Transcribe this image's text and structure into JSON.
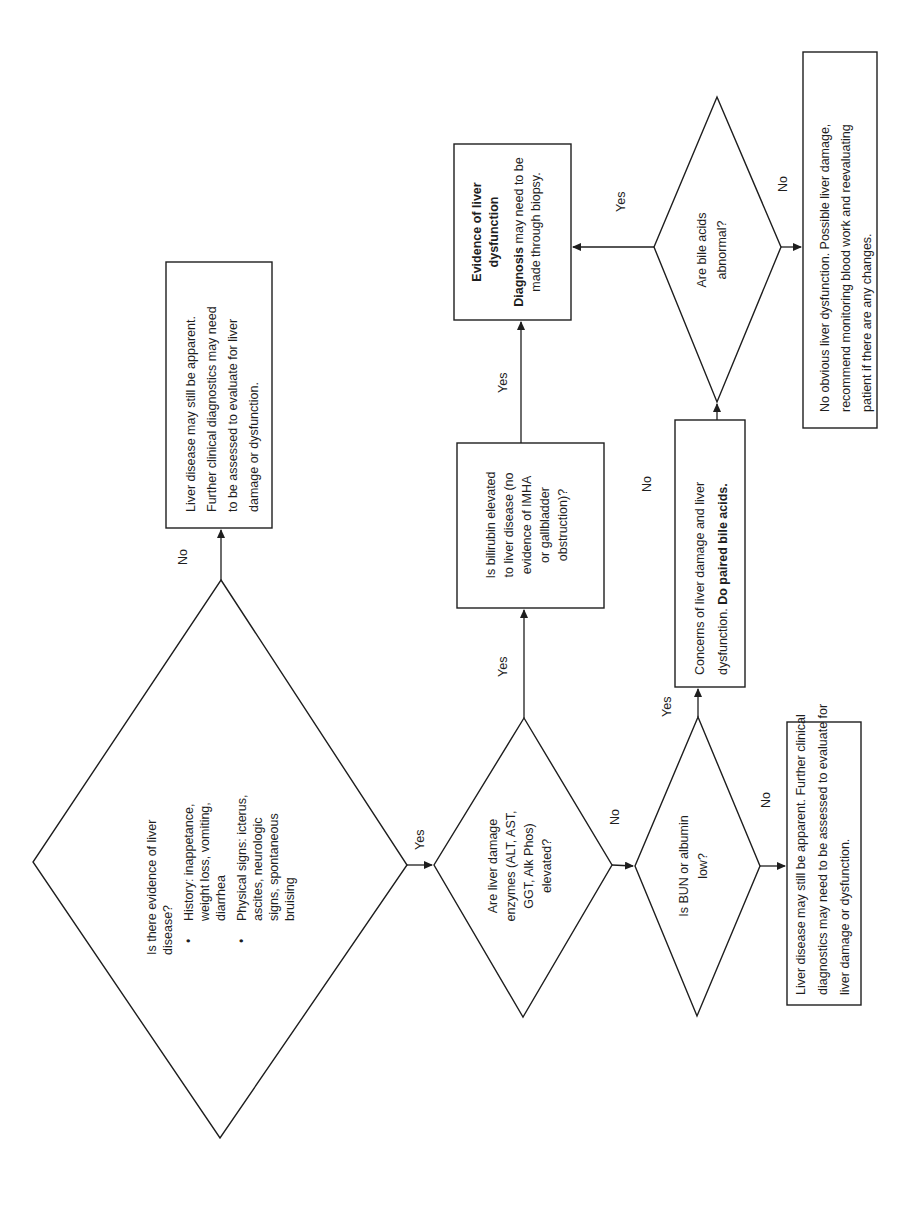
{
  "flowchart": {
    "title_hint": "Liver disease diagnostic decision tree (page rotated 90° counter-clockwise)",
    "orientation": "rotated-90-ccw",
    "nodes": {
      "start": {
        "type": "decision",
        "question": "Is there evidence of liver disease?",
        "lines": [
          "Is there evidence of liver",
          "disease?"
        ],
        "bullets": [
          {
            "lines": [
              "History: inappetance,",
              "weight loss, vomiting,",
              "diarrhea"
            ]
          },
          {
            "lines": [
              "Physical signs: icterus,",
              "ascites, neurologic",
              "signs, spontaneous",
              "bruising"
            ]
          }
        ]
      },
      "no_evidence": {
        "type": "process",
        "lines": [
          "Liver disease may still be apparent.",
          "Further clinical diagnostics may need",
          "to be assessed to evaluate for liver",
          "damage or dysfunction."
        ]
      },
      "enzymes": {
        "type": "decision",
        "lines": [
          "Are liver damage",
          "enzymes (ALT, AST,",
          "GGT, Alk Phos)",
          "elevated?"
        ]
      },
      "bilirubin": {
        "type": "process",
        "lines": [
          "Is bilirubin elevated",
          "to liver disease (no",
          "evidence of IMHA",
          "or gallbladder",
          "obstruction)?"
        ]
      },
      "dysfunction": {
        "type": "process",
        "title_lines": [
          "Evidence of liver",
          "dysfunction"
        ],
        "body_bold": "Diagnosis",
        "body_lines": [
          " may need to be",
          "made through biopsy."
        ]
      },
      "bun": {
        "type": "decision",
        "lines": [
          "Is BUN or albumin",
          "low?"
        ]
      },
      "concerns": {
        "type": "process",
        "line1": "Concerns of liver damage and liver",
        "line2_normal": "dysfunction. ",
        "line2_bold": "Do paired bile acids."
      },
      "bile_acids": {
        "type": "decision",
        "lines": [
          "Are bile acids",
          "abnormal?"
        ]
      },
      "no_obvious": {
        "type": "process",
        "lines": [
          "No obvious liver dysfunction. Possible liver damage,",
          "recommend monitoring blood work and reevaluating",
          "patient if there are any changes."
        ]
      },
      "bun_no": {
        "type": "process",
        "lines": [
          "Liver disease may still be apparent. Further clinical",
          "diagnostics may need to be assessed to evaluate for",
          "liver damage or dysfunction."
        ]
      }
    },
    "edge_labels": {
      "start_no": "No",
      "start_yes": "Yes",
      "enzymes_yes": "Yes",
      "enzymes_no": "No",
      "bilirubin_yes": "Yes",
      "bilirubin_no": "No",
      "bun_yes": "Yes",
      "bun_no": "No",
      "bile_yes": "Yes",
      "bile_no": "No"
    },
    "colors": {
      "stroke": "#1e1e1e",
      "background": "#ffffff"
    }
  }
}
